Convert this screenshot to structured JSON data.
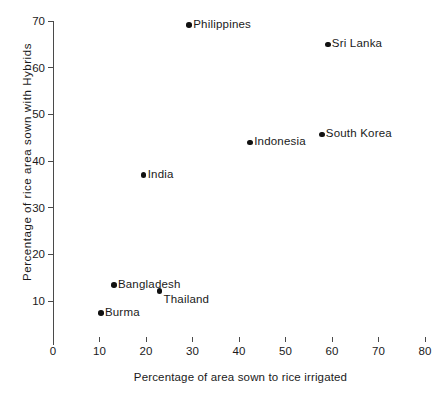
{
  "chart_data": {
    "type": "scatter",
    "title": "",
    "xlabel": "Percentage of area sown to rice irrigated",
    "ylabel": "Percentage of rice area sown with Hybrids",
    "xlim": [
      0,
      80
    ],
    "ylim": [
      0,
      70
    ],
    "xticks": [
      0,
      10,
      20,
      30,
      40,
      50,
      60,
      70,
      80
    ],
    "yticks": [
      10,
      20,
      30,
      40,
      50,
      60,
      70
    ],
    "xtick_labels": [
      "0",
      "10",
      "20",
      "30",
      "40",
      "50",
      "60",
      "70",
      "80"
    ],
    "ytick_labels": [
      "10",
      "20",
      "30",
      "40",
      "50",
      "60",
      "70"
    ],
    "grid": false,
    "legend": "none",
    "marker_color": "#111111",
    "axis_color": "#4a4a4a",
    "points": [
      {
        "label": "Burma",
        "x": 10.3,
        "y": 7.4,
        "label_pos": "right"
      },
      {
        "label": "Bangladesh",
        "x": 13.1,
        "y": 13.4,
        "label_pos": "right"
      },
      {
        "label": "Thailand",
        "x": 22.9,
        "y": 12.1,
        "label_pos": "right-below"
      },
      {
        "label": "India",
        "x": 19.5,
        "y": 37.0,
        "label_pos": "right"
      },
      {
        "label": "Philippines",
        "x": 29.3,
        "y": 69.1,
        "label_pos": "right"
      },
      {
        "label": "Indonesia",
        "x": 42.4,
        "y": 44.0,
        "label_pos": "right"
      },
      {
        "label": "South Korea",
        "x": 57.8,
        "y": 45.7,
        "label_pos": "right"
      },
      {
        "label": "Sri Lanka",
        "x": 59.1,
        "y": 65.0,
        "label_pos": "right"
      }
    ]
  }
}
